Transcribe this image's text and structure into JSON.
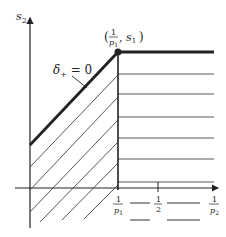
{
  "diagram": {
    "y_axis_label": "s",
    "y_axis_sub": "2",
    "boundary_label": "δ",
    "boundary_label_sub": "+",
    "boundary_label_rest": " = 0",
    "point_label_open": "(",
    "point_label_num": "1",
    "point_label_den": "p",
    "point_label_den_sub": "1",
    "point_label_sep": ", ",
    "point_label_s": "s",
    "point_label_s_sub": "1",
    "point_label_close": ")",
    "x_ticks": [
      {
        "num": "1",
        "den": "p",
        "den_sub": "1"
      },
      {
        "num": "1",
        "den": "2",
        "den_sub": ""
      },
      {
        "num": "1",
        "den": "p",
        "den_sub": "2"
      }
    ],
    "colors": {
      "line": "#222222",
      "hatch": "#444444"
    }
  }
}
